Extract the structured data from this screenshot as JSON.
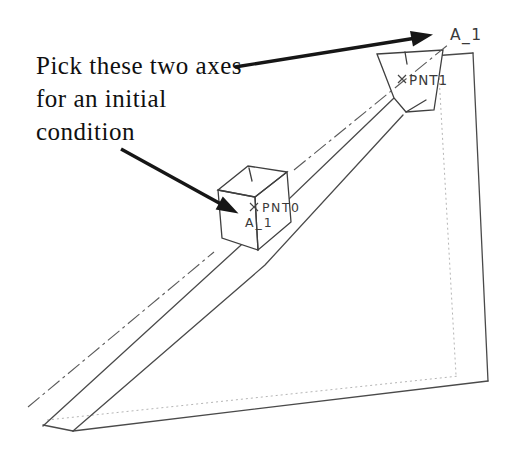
{
  "figure": {
    "annotation": {
      "lines": [
        "Pick these two axes",
        "for an initial",
        "condition"
      ]
    },
    "labels": {
      "ramp_axis_top": "A_1",
      "block_axis": "A_1",
      "block_point": "PNT0",
      "ramp_point": "PNT1"
    },
    "colors": {
      "background": "#ffffff",
      "edge_line": "#4a4a4a",
      "hidden_line": "#b5b5b5",
      "centerline": "#5a5a5a",
      "annotation_text": "#101010",
      "arrow": "#161616",
      "label_text": "#3a3a3a"
    }
  }
}
